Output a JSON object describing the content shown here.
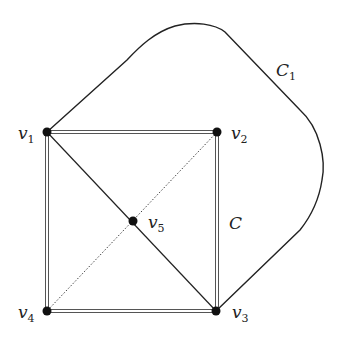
{
  "diagram": {
    "type": "graph",
    "vertices": [
      {
        "id": "v1",
        "label": "v",
        "sub": "1",
        "x": 47,
        "y": 132
      },
      {
        "id": "v2",
        "label": "v",
        "sub": "2",
        "x": 217,
        "y": 132
      },
      {
        "id": "v3",
        "label": "v",
        "sub": "3",
        "x": 216,
        "y": 311
      },
      {
        "id": "v4",
        "label": "v",
        "sub": "4",
        "x": 47,
        "y": 311
      },
      {
        "id": "v5",
        "label": "v",
        "sub": "5",
        "x": 133,
        "y": 221
      }
    ],
    "edges": [
      {
        "from": "v1",
        "to": "v2",
        "style": "double"
      },
      {
        "from": "v2",
        "to": "v3",
        "style": "double"
      },
      {
        "from": "v3",
        "to": "v4",
        "style": "double"
      },
      {
        "from": "v4",
        "to": "v1",
        "style": "double"
      },
      {
        "from": "v1",
        "to": "v3",
        "style": "solid",
        "via": "v5"
      },
      {
        "from": "v2",
        "to": "v4",
        "style": "dotted",
        "via": "v5"
      },
      {
        "from": "v1",
        "to": "v3",
        "style": "curve",
        "name": "C1"
      }
    ],
    "cycle_labels": {
      "inner": {
        "text": "C",
        "sub": ""
      },
      "outer": {
        "text": "C",
        "sub": "1"
      }
    }
  }
}
